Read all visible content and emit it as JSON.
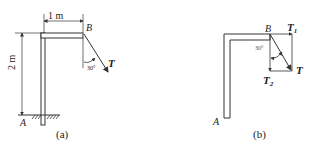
{
  "figure_a": {
    "caption": "(a)",
    "point_A": "A",
    "point_B": "B",
    "dim_horizontal": "1 m",
    "dim_vertical": "2 m",
    "angle": "30°",
    "force": "T"
  },
  "figure_b": {
    "caption": "(b)",
    "point_A": "A",
    "point_B": "B",
    "angle": "30°",
    "force": "T",
    "component_1": "T",
    "component_1_sub": "1",
    "component_2": "T",
    "component_2_sub": "2"
  },
  "colors": {
    "line": "#333333",
    "beam_fill": "#ffffff"
  }
}
